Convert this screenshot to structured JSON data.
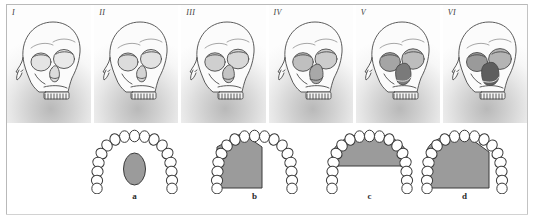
{
  "figure": {
    "background_color": "#ffffff",
    "frame_color": "#b9b9b9",
    "panel_count": 6,
    "arch_count": 4
  },
  "skull_row": {
    "description": "Six shaded three-quarter-view human skull drawings on light grey gradient panels",
    "panels": [
      {
        "label": "I",
        "icon": "skull-icon",
        "nasal_aperture": "narrow, lightly shaded",
        "orbit_shading": "light"
      },
      {
        "label": "II",
        "icon": "skull-icon",
        "nasal_aperture": "narrow, lightly shaded",
        "orbit_shading": "light"
      },
      {
        "label": "III",
        "icon": "skull-icon",
        "nasal_aperture": "moderate, shaded",
        "orbit_shading": "medium"
      },
      {
        "label": "IV",
        "icon": "skull-icon",
        "nasal_aperture": "moderate, darker",
        "orbit_shading": "medium"
      },
      {
        "label": "V",
        "icon": "skull-icon",
        "nasal_aperture": "wide, dark",
        "orbit_shading": "dark"
      },
      {
        "label": "VI",
        "icon": "skull-icon",
        "nasal_aperture": "wide, very dark",
        "orbit_shading": "dark"
      }
    ]
  },
  "arch_row": {
    "description": "Four maxillary dental arch (palate) outlines with grey shaded palatal regions",
    "tooth_count_per_arch": 16,
    "shaded_fill_color": "#9b9b9b",
    "outline_color": "#3a3a3a",
    "cells": [
      {
        "label": "a",
        "shape": "small central oval (torus palatinus)",
        "shape_kind": "oval"
      },
      {
        "label": "b",
        "shape": "pentagon with bevelled upper-right corner filling left half of palate",
        "shape_kind": "pentagon-left"
      },
      {
        "label": "c",
        "shape": "wide arch band across anterior palate",
        "shape_kind": "band-anterior"
      },
      {
        "label": "d",
        "shape": "large pentagon with bevelled upper-right corner filling most of palate",
        "shape_kind": "pentagon-large"
      }
    ]
  }
}
